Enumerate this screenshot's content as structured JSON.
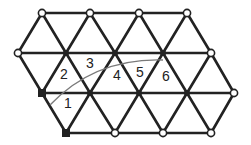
{
  "diagram": {
    "type": "triangular-lattice",
    "colors": {
      "edge": "#222222",
      "arc": "#7a7a7a",
      "background": "#ffffff"
    },
    "vertices": [
      {
        "id": "r0c0",
        "x": 42,
        "y": 13,
        "style": "open"
      },
      {
        "id": "r0c1",
        "x": 90,
        "y": 13,
        "style": "open"
      },
      {
        "id": "r0c2",
        "x": 139,
        "y": 13,
        "style": "open"
      },
      {
        "id": "r0c3",
        "x": 187,
        "y": 13,
        "style": "open"
      },
      {
        "id": "r1c0",
        "x": 18,
        "y": 53,
        "style": "open"
      },
      {
        "id": "r1c1",
        "x": 66,
        "y": 53,
        "style": "filled"
      },
      {
        "id": "r1c2",
        "x": 115,
        "y": 53,
        "style": "filled"
      },
      {
        "id": "r1c3",
        "x": 163,
        "y": 53,
        "style": "filled"
      },
      {
        "id": "r1c4",
        "x": 211,
        "y": 53,
        "style": "open"
      },
      {
        "id": "r2c0",
        "x": 42,
        "y": 93,
        "style": "square"
      },
      {
        "id": "r2c1",
        "x": 90,
        "y": 93,
        "style": "filled"
      },
      {
        "id": "r2c2",
        "x": 139,
        "y": 93,
        "style": "filled"
      },
      {
        "id": "r2c3",
        "x": 187,
        "y": 93,
        "style": "filled"
      },
      {
        "id": "r2c4",
        "x": 234,
        "y": 93,
        "style": "open"
      },
      {
        "id": "r3c0",
        "x": 66,
        "y": 133,
        "style": "square"
      },
      {
        "id": "r3c1",
        "x": 115,
        "y": 133,
        "style": "open"
      },
      {
        "id": "r3c2",
        "x": 163,
        "y": 133,
        "style": "open"
      },
      {
        "id": "r3c3",
        "x": 211,
        "y": 133,
        "style": "open"
      }
    ],
    "edges": [
      [
        "r0c0",
        "r0c1"
      ],
      [
        "r0c1",
        "r0c2"
      ],
      [
        "r0c2",
        "r0c3"
      ],
      [
        "r1c0",
        "r1c1"
      ],
      [
        "r1c1",
        "r1c2"
      ],
      [
        "r1c2",
        "r1c3"
      ],
      [
        "r1c3",
        "r1c4"
      ],
      [
        "r2c0",
        "r2c1"
      ],
      [
        "r2c1",
        "r2c2"
      ],
      [
        "r2c2",
        "r2c3"
      ],
      [
        "r2c3",
        "r2c4"
      ],
      [
        "r3c0",
        "r3c1"
      ],
      [
        "r3c1",
        "r3c2"
      ],
      [
        "r3c2",
        "r3c3"
      ],
      [
        "r0c0",
        "r1c0"
      ],
      [
        "r0c0",
        "r1c1"
      ],
      [
        "r0c1",
        "r1c1"
      ],
      [
        "r0c1",
        "r1c2"
      ],
      [
        "r0c2",
        "r1c2"
      ],
      [
        "r0c2",
        "r1c3"
      ],
      [
        "r0c3",
        "r1c3"
      ],
      [
        "r0c3",
        "r1c4"
      ],
      [
        "r1c0",
        "r2c0"
      ],
      [
        "r1c1",
        "r2c0"
      ],
      [
        "r1c1",
        "r2c1"
      ],
      [
        "r1c2",
        "r2c1"
      ],
      [
        "r1c2",
        "r2c2"
      ],
      [
        "r1c3",
        "r2c2"
      ],
      [
        "r1c3",
        "r2c3"
      ],
      [
        "r1c4",
        "r2c3"
      ],
      [
        "r1c4",
        "r2c4"
      ],
      [
        "r2c0",
        "r3c0"
      ],
      [
        "r2c1",
        "r3c0"
      ],
      [
        "r2c1",
        "r3c1"
      ],
      [
        "r2c2",
        "r3c1"
      ],
      [
        "r2c2",
        "r3c2"
      ],
      [
        "r2c3",
        "r3c2"
      ],
      [
        "r2c3",
        "r3c3"
      ],
      [
        "r2c4",
        "r3c3"
      ]
    ],
    "arc": {
      "path": "M 50 105 Q 95 58 163 60"
    },
    "labels": [
      {
        "text": "1",
        "x": 64,
        "y": 108
      },
      {
        "text": "2",
        "x": 60,
        "y": 79
      },
      {
        "text": "3",
        "x": 86,
        "y": 68
      },
      {
        "text": "4",
        "x": 113,
        "y": 80
      },
      {
        "text": "5",
        "x": 136,
        "y": 77
      },
      {
        "text": "6",
        "x": 162,
        "y": 81
      }
    ]
  }
}
